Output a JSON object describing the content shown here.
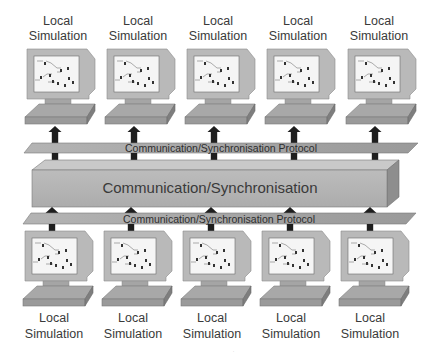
{
  "diagram": {
    "top_nodes": [
      {
        "line1": "Local",
        "line2": "Simulation"
      },
      {
        "line1": "Local",
        "line2": "Simulation"
      },
      {
        "line1": "Local",
        "line2": "Simulation"
      },
      {
        "line1": "Local",
        "line2": "Simulation"
      },
      {
        "line1": "Local",
        "line2": "Simulation"
      }
    ],
    "bottom_nodes": [
      {
        "line1": "Local",
        "line2": "Simulation"
      },
      {
        "line1": "Local",
        "line2": "Simulation"
      },
      {
        "line1": "Local",
        "line2": "Simulation"
      },
      {
        "line1": "Local",
        "line2": "Simulation"
      },
      {
        "line1": "Local",
        "line2": "Simulation"
      }
    ],
    "upper_protocol_label": "Communication/Synchronisation Protocol",
    "lower_protocol_label": "Communication/Synchronisation Protocol",
    "core_label": "Communication/Synchronisation",
    "node_icon": "computer-monitor-icon",
    "link_icon": "bidirectional-arrow-icon",
    "colors": {
      "monitor_frame": "#b8b8b8",
      "monitor_dark": "#8a8a8a",
      "screen": "#f4f4f4",
      "plate": "#a9a9a9",
      "box_front": "#b5b5b5",
      "box_top": "#c8c8c8",
      "box_side": "#8c8c8c",
      "arrow": "#1e1e1e",
      "text": "#3a3a3a"
    }
  }
}
